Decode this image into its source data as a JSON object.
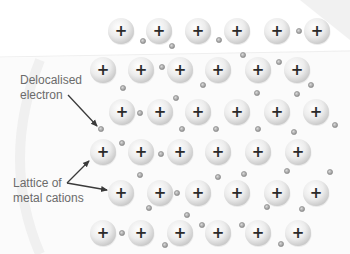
{
  "diagram": {
    "labels": {
      "delocalised_line1": "Delocalised",
      "delocalised_line2": "electron",
      "lattice_line1": "Lattice of",
      "lattice_line2": "metal cations"
    },
    "cation_symbol": "+",
    "colors": {
      "cation_fill_light": "#ffffff",
      "cation_fill_dark": "#cfcfcf",
      "cation_sign": "#2a2a2a",
      "electron": "#9a9a9a",
      "label_text": "#6b6b6b",
      "arrow": "#3a3a3a",
      "background_band": "#f6f6f6"
    },
    "cation_radius": 13,
    "electron_radius": 2.6,
    "cations": [
      {
        "row": 1,
        "y": 31,
        "x": [
          121,
          159,
          198,
          237,
          277,
          317
        ]
      },
      {
        "row": 2,
        "y": 70,
        "x": [
          103,
          141,
          180,
          218,
          258,
          297
        ]
      },
      {
        "row": 3,
        "y": 112,
        "x": [
          122,
          160,
          198,
          237,
          277,
          316
        ]
      },
      {
        "row": 4,
        "y": 152,
        "x": [
          103,
          141,
          180,
          218,
          258,
          298
        ]
      },
      {
        "row": 5,
        "y": 193,
        "x": [
          121,
          160,
          198,
          237,
          277,
          316
        ]
      },
      {
        "row": 6,
        "y": 233,
        "x": [
          103,
          141,
          180,
          218,
          258,
          298
        ]
      }
    ],
    "electrons": [
      [
        143,
        41
      ],
      [
        172,
        46
      ],
      [
        219,
        40
      ],
      [
        299,
        31
      ],
      [
        243,
        55
      ],
      [
        162,
        67
      ],
      [
        279,
        62
      ],
      [
        123,
        88
      ],
      [
        203,
        85
      ],
      [
        311,
        85
      ],
      [
        257,
        93
      ],
      [
        297,
        94
      ],
      [
        176,
        98
      ],
      [
        140,
        113
      ],
      [
        101,
        129
      ],
      [
        182,
        129
      ],
      [
        216,
        129
      ],
      [
        258,
        129
      ],
      [
        294,
        132
      ],
      [
        335,
        125
      ],
      [
        122,
        143
      ],
      [
        161,
        154
      ],
      [
        140,
        175
      ],
      [
        218,
        177
      ],
      [
        244,
        174
      ],
      [
        287,
        171
      ],
      [
        330,
        172
      ],
      [
        177,
        193
      ],
      [
        149,
        208
      ],
      [
        267,
        207
      ],
      [
        302,
        209
      ],
      [
        187,
        215
      ],
      [
        122,
        233
      ],
      [
        202,
        225
      ],
      [
        242,
        225
      ],
      [
        165,
        245
      ],
      [
        281,
        244
      ]
    ],
    "arrows": [
      {
        "name": "delocalised-electron-arrow",
        "from": [
          68,
          95
        ],
        "to": [
          97,
          126
        ]
      },
      {
        "name": "lattice-arrow-upper",
        "from": [
          67,
          183
        ],
        "to": [
          89,
          161
        ]
      },
      {
        "name": "lattice-arrow-lower",
        "from": [
          67,
          183
        ],
        "to": [
          107,
          190
        ]
      }
    ]
  }
}
